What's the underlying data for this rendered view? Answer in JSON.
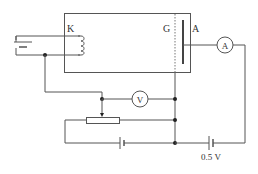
{
  "diagram": {
    "labels": {
      "cathode": "K",
      "grid": "G",
      "anode": "A",
      "ammeter": "A",
      "voltmeter": "V",
      "retarding_voltage": "0.5 V"
    },
    "components": [
      {
        "name": "tube",
        "type": "vacuum tube"
      },
      {
        "name": "filament-battery",
        "type": "battery"
      },
      {
        "name": "cathode-heater",
        "type": "coil"
      },
      {
        "name": "grid",
        "type": "dashed electrode"
      },
      {
        "name": "anode",
        "type": "plate electrode"
      },
      {
        "name": "ammeter",
        "type": "meter"
      },
      {
        "name": "voltmeter",
        "type": "meter"
      },
      {
        "name": "rheostat",
        "type": "variable resistor"
      },
      {
        "name": "accelerating-battery",
        "type": "battery"
      },
      {
        "name": "retarding-battery",
        "type": "battery",
        "value": "0.5 V"
      }
    ],
    "colors": {
      "line": "#555555",
      "background": "#ffffff"
    }
  }
}
